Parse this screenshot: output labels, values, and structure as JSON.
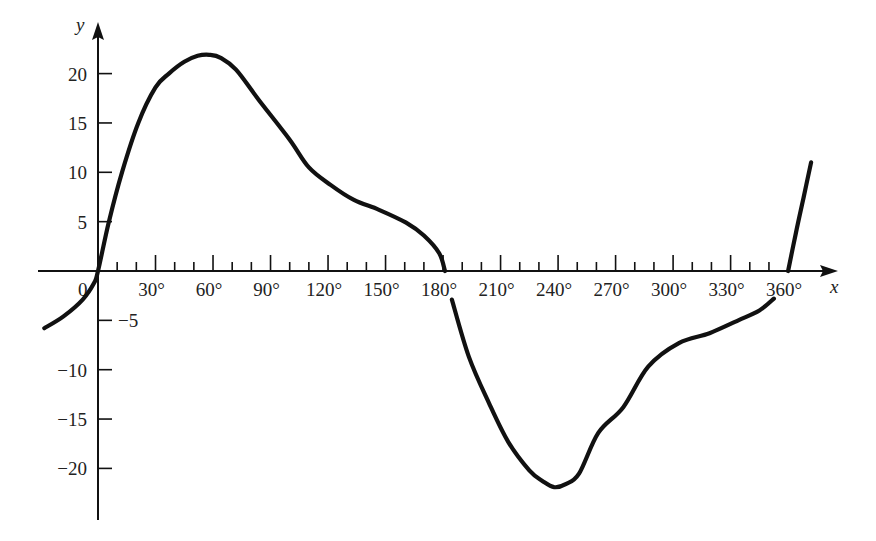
{
  "chart_data": {
    "type": "line",
    "title": "",
    "xlabel": "x",
    "ylabel": "y",
    "x_unit": "degrees",
    "xlim": [
      -28,
      372
    ],
    "ylim": [
      -25,
      25
    ],
    "grid": false,
    "legend": null,
    "origin_label": "0",
    "x_ticks_minor_step": 10,
    "x_ticks_major_step": 30,
    "x_tick_labels": [
      "30°",
      "60°",
      "90°",
      "120°",
      "150°",
      "180°",
      "210°",
      "240°",
      "270°",
      "300°",
      "330°",
      "360°"
    ],
    "x_tick_values": [
      30,
      60,
      90,
      120,
      150,
      180,
      210,
      240,
      270,
      300,
      330,
      360
    ],
    "y_tick_labels": [
      "20",
      "15",
      "10",
      "5",
      "−5",
      "−10",
      "−15",
      "−20"
    ],
    "y_tick_values": [
      20,
      15,
      10,
      5,
      -5,
      -10,
      -15,
      -20
    ],
    "series": [
      {
        "name": "curve segment 1",
        "x": [
          -28,
          -18,
          -8,
          -2,
          0,
          5.7,
          12.5,
          21,
          30,
          37,
          45,
          52,
          58,
          64,
          72,
          84,
          100,
          110,
          121.5,
          133.5,
          146.6,
          160.7,
          170,
          178,
          181
        ],
        "y": [
          -5.8,
          -4.6,
          -2.9,
          -1.2,
          0,
          5,
          10,
          15,
          18.6,
          20,
          21.2,
          21.8,
          21.9,
          21.6,
          20.4,
          17.3,
          13.3,
          10.5,
          8.7,
          7.2,
          6.2,
          4.9,
          3.6,
          1.8,
          0
        ]
      },
      {
        "name": "curve segment 2",
        "x": [
          184.6,
          193.5,
          204,
          214,
          225,
          232,
          238,
          244,
          251,
          261,
          274,
          287,
          303,
          319,
          334,
          345,
          352.6
        ],
        "y": [
          -2.9,
          -8.7,
          -13.4,
          -17.3,
          -20.2,
          -21.3,
          -21.9,
          -21.6,
          -20.5,
          -16.4,
          -13.8,
          -9.7,
          -7.3,
          -6.3,
          -5.0,
          -4.0,
          -2.8
        ]
      },
      {
        "name": "curve segment 3",
        "x": [
          360,
          364,
          368,
          372
        ],
        "y": [
          0,
          3.8,
          7.4,
          11
        ]
      }
    ]
  }
}
